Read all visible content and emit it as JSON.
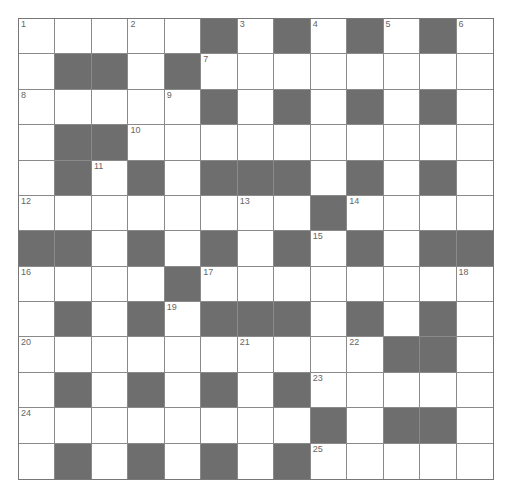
{
  "puzzle": {
    "rows": 13,
    "cols": 13,
    "colors": {
      "block": "#6e6e6e",
      "cell": "#ffffff",
      "grid_line": "#8a8a8a",
      "number": "#666666"
    },
    "grid": [
      "WWWWWBWBWBWBW",
      "WBBWBWWWWWWWW",
      "WWWWWBWBWBWBW",
      "WBBWWWWWWWWWW",
      "WBWBWBBBWBWBW",
      "WWWWWWWWBWWWW",
      "BBWBWBWBWBWBB",
      "WWWWBWWWWWWWW",
      "WBWBWBBBWBWBW",
      "WWWWWWWWWWBBW",
      "WBWBWBWBWWWWW",
      "WWWWWWWWBWBBW",
      "WBWBWBWBWWWWW"
    ],
    "numbers": [
      {
        "row": 0,
        "col": 0,
        "n": "1"
      },
      {
        "row": 0,
        "col": 3,
        "n": "2"
      },
      {
        "row": 0,
        "col": 6,
        "n": "3"
      },
      {
        "row": 0,
        "col": 8,
        "n": "4"
      },
      {
        "row": 0,
        "col": 10,
        "n": "5"
      },
      {
        "row": 0,
        "col": 12,
        "n": "6"
      },
      {
        "row": 1,
        "col": 5,
        "n": "7"
      },
      {
        "row": 2,
        "col": 0,
        "n": "8"
      },
      {
        "row": 2,
        "col": 4,
        "n": "9"
      },
      {
        "row": 3,
        "col": 3,
        "n": "10"
      },
      {
        "row": 4,
        "col": 2,
        "n": "11"
      },
      {
        "row": 5,
        "col": 0,
        "n": "12"
      },
      {
        "row": 5,
        "col": 6,
        "n": "13"
      },
      {
        "row": 5,
        "col": 9,
        "n": "14"
      },
      {
        "row": 6,
        "col": 8,
        "n": "15"
      },
      {
        "row": 7,
        "col": 0,
        "n": "16"
      },
      {
        "row": 7,
        "col": 5,
        "n": "17"
      },
      {
        "row": 7,
        "col": 12,
        "n": "18"
      },
      {
        "row": 8,
        "col": 4,
        "n": "19"
      },
      {
        "row": 9,
        "col": 0,
        "n": "20"
      },
      {
        "row": 9,
        "col": 6,
        "n": "21"
      },
      {
        "row": 9,
        "col": 9,
        "n": "22"
      },
      {
        "row": 10,
        "col": 8,
        "n": "23"
      },
      {
        "row": 11,
        "col": 0,
        "n": "24"
      },
      {
        "row": 12,
        "col": 8,
        "n": "25"
      }
    ],
    "letters": []
  }
}
